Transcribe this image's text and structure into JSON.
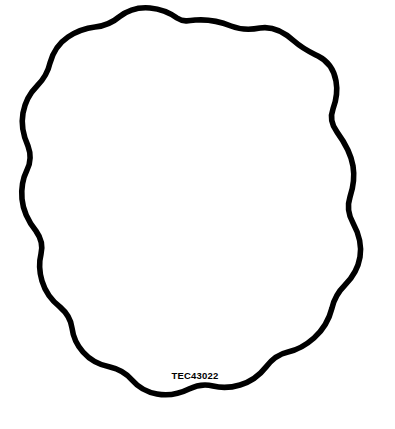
{
  "figure": {
    "kind": "technical-part-outline-drawing",
    "background_color": "#ffffff",
    "outline_color": "#000000",
    "fill_color": "#ffffff",
    "stroke_width_px": 5.6,
    "canvas": {
      "width": 395,
      "height": 429
    },
    "bounds": {
      "left_px": 12,
      "top_px": 19,
      "right_px": 362,
      "bottom_px": 396
    }
  },
  "label": {
    "part_number": "TEC43022",
    "x": 195,
    "y": 379,
    "color": "#000000",
    "font_size_px": 9.5,
    "anchor": "middle"
  },
  "outline": {
    "closed": true,
    "description": "irregular wavy near-circular closed contour with shallow lobes",
    "path": "M 196 20 C 210 19 221 22 231 26 C 241 30 250 30 260 28 C 272 26 283 31 294 41 C 303 49 310 52 318 56 C 328 61 334 70 336 81 C 338 92 336 101 333 109 C 330 117 331 124 337 132 C 345 143 351 154 353 166 C 355 178 353 188 350 197 C 347 206 348 214 353 223 C 359 234 362 245 360 257 C 358 269 352 278 345 285 C 338 292 334 299 332 308 C 329 320 323 330 314 338 C 305 346 297 350 288 352 C 279 354 272 359 266 367 C 259 376 250 382 240 385 C 230 388 221 388 213 386 C 205 384 197 385 189 389 C 179 394 168 396 157 394 C 146 392 138 387 132 380 C 126 373 119 369 110 367 C 99 365 90 360 83 352 C 76 344 73 336 72 328 C 71 320 67 313 60 307 C 51 300 45 291 42 281 C 39 271 39 262 41 254 C 43 246 41 238 36 231 C 28 221 23 210 22 199 C 21 188 23 178 27 170 C 31 162 31 154 28 146 C 23 135 21 124 23 113 C 25 102 30 93 37 86 C 44 79 48 72 50 63 C 53 52 59 43 68 37 C 77 31 86 28 95 27 C 104 26 112 23 119 17 C 128 10 139 7 150 8 C 161 9 170 13 177 18 C 183 22 189 21 196 20 Z"
  }
}
